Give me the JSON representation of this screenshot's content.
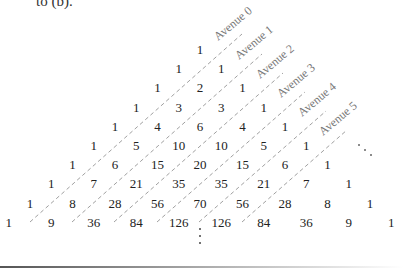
{
  "caption": "to (b).",
  "triangle": {
    "rows": [
      [
        1
      ],
      [
        1,
        1
      ],
      [
        1,
        2,
        1
      ],
      [
        1,
        3,
        3,
        1
      ],
      [
        1,
        4,
        6,
        4,
        1
      ],
      [
        1,
        5,
        10,
        10,
        5,
        1
      ],
      [
        1,
        6,
        15,
        20,
        15,
        6,
        1
      ],
      [
        1,
        7,
        21,
        35,
        35,
        21,
        7,
        1
      ],
      [
        1,
        8,
        28,
        56,
        70,
        56,
        28,
        8,
        1
      ],
      [
        1,
        9,
        36,
        84,
        126,
        126,
        84,
        36,
        9,
        1
      ]
    ],
    "avenues": [
      "Avenue 0",
      "Avenue 1",
      "Avenue 2",
      "Avenue 3",
      "Avenue 4",
      "Avenue 5"
    ],
    "continuation_vertical": "⋮",
    "continuation_diagonal": "⋰"
  }
}
